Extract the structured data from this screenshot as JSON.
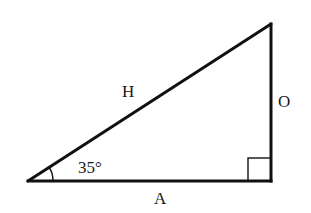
{
  "diagram": {
    "type": "right-triangle",
    "stroke_color": "#111111",
    "background": "#ffffff",
    "labels": {
      "hypotenuse": "H",
      "opposite": "O",
      "adjacent": "A",
      "angle": "35°"
    },
    "angle_degrees": 35,
    "right_angle_marker": true
  }
}
